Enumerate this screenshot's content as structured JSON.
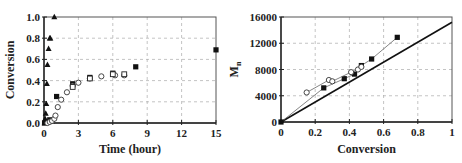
{
  "chart_data": [
    {
      "type": "scatter",
      "title": "",
      "xlabel": "Time (hour)",
      "ylabel": "Conversion",
      "xlim": [
        0,
        15
      ],
      "ylim": [
        0,
        1.0
      ],
      "xticks": [
        "0",
        "3",
        "6",
        "9",
        "12",
        "15"
      ],
      "yticks": [
        "0.0",
        "0.2",
        "0.4",
        "0.6",
        "0.8",
        "1.0"
      ],
      "grid": true,
      "legend": null,
      "series": [
        {
          "name": "filled triangles",
          "marker": "triangle-filled",
          "x": [
            0.05,
            0.1,
            0.15,
            0.2,
            0.25,
            0.3,
            0.4,
            0.5,
            0.55,
            0.9
          ],
          "y": [
            0.0,
            0.04,
            0.09,
            0.18,
            0.37,
            0.55,
            0.7,
            0.8,
            0.8,
            1.0
          ]
        },
        {
          "name": "filled squares",
          "marker": "square-filled",
          "x": [
            0.05,
            0.3,
            0.5,
            0.7,
            1.1,
            2.5,
            4.0,
            6.0,
            8.0,
            15.0
          ],
          "y": [
            0.0,
            0.01,
            0.03,
            0.02,
            0.25,
            0.37,
            0.43,
            0.47,
            0.53,
            0.69
          ]
        },
        {
          "name": "open circles",
          "marker": "circle-open",
          "x": [
            0.3,
            0.5,
            0.7,
            0.9,
            1.0,
            1.2,
            1.5,
            2.0,
            2.5,
            3.0,
            4.0,
            5.0,
            6.2,
            7.0
          ],
          "y": [
            0.0,
            0.01,
            0.02,
            0.04,
            0.07,
            0.15,
            0.22,
            0.29,
            0.35,
            0.38,
            0.42,
            0.44,
            0.45,
            0.45
          ]
        },
        {
          "name": "open squares",
          "marker": "square-open",
          "x": [
            2.5,
            4.0,
            6.0,
            7.0
          ],
          "y": [
            0.34,
            0.42,
            0.46,
            0.46
          ]
        }
      ]
    },
    {
      "type": "scatter",
      "title": "",
      "xlabel": "Conversion",
      "ylabel": "Mn",
      "xlim": [
        0,
        1
      ],
      "ylim": [
        0,
        16000
      ],
      "xticks": [
        "0",
        "0.2",
        "0.4",
        "0.6",
        "0.8",
        "1"
      ],
      "yticks": [
        "0",
        "4000",
        "8000",
        "12000",
        "16000"
      ],
      "grid": true,
      "legend": null,
      "series": [
        {
          "name": "theoretical line",
          "marker": "none",
          "line": "solid-thick",
          "x": [
            0,
            1
          ],
          "y": [
            0,
            15200
          ]
        },
        {
          "name": "filled squares",
          "marker": "square-filled",
          "line": "thin",
          "x": [
            0,
            0.25,
            0.37,
            0.43,
            0.47,
            0.53,
            0.68
          ],
          "y": [
            0,
            5200,
            6600,
            7300,
            8600,
            9600,
            12900
          ]
        },
        {
          "name": "open circles",
          "marker": "circle-open",
          "line": "thin",
          "x": [
            0.15,
            0.28,
            0.3,
            0.41,
            0.45,
            0.47
          ],
          "y": [
            4500,
            6400,
            6200,
            7600,
            8000,
            8400
          ]
        }
      ]
    }
  ]
}
